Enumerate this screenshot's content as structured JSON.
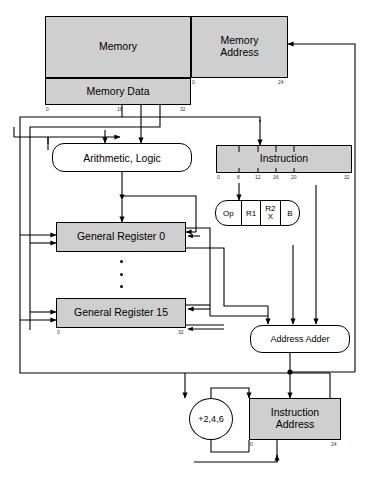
{
  "figure": {
    "type": "block-diagram",
    "fill_color": "#cfcfcf",
    "line_color": "#000000"
  },
  "blocks": {
    "memory": {
      "label": "Memory"
    },
    "memory_address": {
      "label": "Memory\nAddress",
      "line1": "Memory",
      "line2": "Address",
      "bit_start": "0",
      "bit_end": "24"
    },
    "memory_data": {
      "label": "Memory Data",
      "bit_start": "0",
      "bit_mid": "16",
      "bit_end": "32"
    },
    "arithmetic_logic": {
      "label": "Arithmetic, Logic"
    },
    "register_0": {
      "label": "General Register 0"
    },
    "register_15": {
      "label": "General Register 15",
      "bit_start": "0",
      "bit_end": "32"
    },
    "instruction": {
      "label": "Instruction",
      "ticks": [
        "0",
        "8",
        "12",
        "16",
        "20",
        "32"
      ]
    },
    "decode": {
      "fields": [
        "Op",
        "R1",
        "R2\nX",
        "B"
      ],
      "op": "Op",
      "r1": "R1",
      "r2x_line1": "R2",
      "r2x_line2": "X",
      "b": "B"
    },
    "address_adder": {
      "label": "Address Adder"
    },
    "increment": {
      "label": "+2,4,6"
    },
    "instruction_address": {
      "label": "Instruction\nAddress",
      "line1": "Instruction",
      "line2": "Address",
      "bit_start": "0",
      "bit_end": "24"
    }
  },
  "ellipsis": {
    "marker": "vertical-dots",
    "count": 3
  }
}
